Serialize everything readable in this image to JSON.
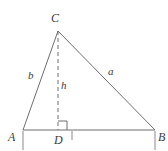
{
  "figure": {
    "kind": "geometry-diagram",
    "canvas": {
      "width": 168,
      "height": 151,
      "background": "#ffffff"
    },
    "stroke_color": "#6e6e6e",
    "label_color": "#3c3c3c",
    "stroke_width": 1,
    "vertices": [
      {
        "id": "A",
        "label": "A",
        "x": 23,
        "y": 130,
        "label_x": 8,
        "label_y": 131
      },
      {
        "id": "B",
        "label": "B",
        "x": 155,
        "y": 130,
        "label_x": 158,
        "label_y": 131
      },
      {
        "id": "C",
        "label": "C",
        "x": 58,
        "y": 31,
        "label_x": 51,
        "label_y": 12
      },
      {
        "id": "D",
        "label": "D",
        "x": 58,
        "y": 130,
        "label_x": 54,
        "label_y": 134
      }
    ],
    "sides": [
      {
        "id": "b",
        "label": "b",
        "from": "A",
        "to": "C",
        "label_x": 28,
        "label_y": 70
      },
      {
        "id": "a",
        "label": "a",
        "from": "C",
        "to": "B",
        "label_x": 108,
        "label_y": 66
      },
      {
        "id": "base",
        "label": "",
        "from": "A",
        "to": "B",
        "label_x": 0,
        "label_y": 0
      }
    ],
    "altitude": {
      "id": "h",
      "label": "h",
      "from": "C",
      "to": "D",
      "style": "dashed",
      "dash_pattern": "4 3",
      "label_x": 61,
      "label_y": 80
    },
    "right_angle_marker": {
      "id": "right-angle-at-D",
      "x": 58,
      "y": 130,
      "size": 8,
      "orientation": "up-right"
    },
    "tick_marks": [
      {
        "id": "tick-A",
        "x": 23,
        "y_top": 131,
        "y_bottom": 150
      },
      {
        "id": "tick-D",
        "x": 72,
        "y_top": 131,
        "y_bottom": 140
      },
      {
        "id": "tick-B",
        "x": 155,
        "y_top": 131,
        "y_bottom": 150
      }
    ]
  }
}
